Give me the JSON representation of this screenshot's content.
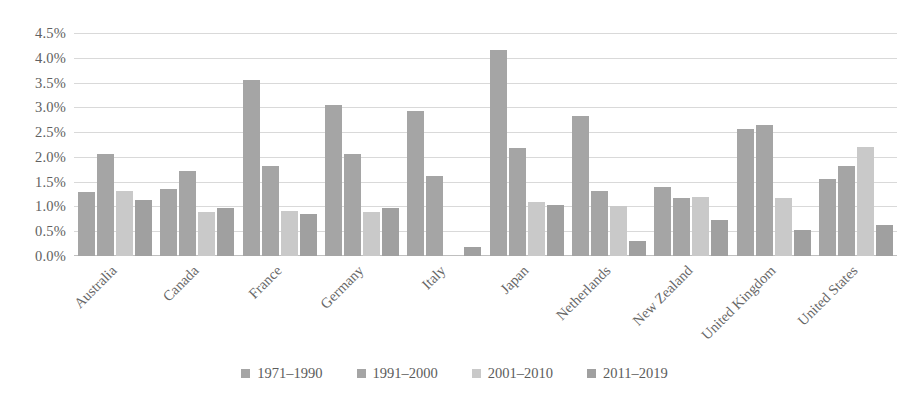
{
  "chart_data": {
    "type": "bar",
    "title": "",
    "xlabel": "",
    "ylabel": "",
    "ylim": [
      0,
      4.5
    ],
    "ytick_step": 0.5,
    "grid": true,
    "legend_position": "bottom",
    "value_unit": "percent",
    "categories": [
      "Australia",
      "Canada",
      "France",
      "Germany",
      "Italy",
      "Japan",
      "Netherlands",
      "New Zealand",
      "United Kingdom",
      "United States"
    ],
    "ytick_labels": [
      "4.5%",
      "4.0%",
      "3.5%",
      "3.0%",
      "2.5%",
      "2.0%",
      "1.5%",
      "1.0%",
      "0.5%",
      "0.0%"
    ],
    "ytick_values": [
      4.5,
      4.0,
      3.5,
      3.0,
      2.5,
      2.0,
      1.5,
      1.0,
      0.5,
      0.0
    ],
    "series": [
      {
        "name": "1971–1990",
        "color": "#a5a5a5",
        "values": [
          1.3,
          1.35,
          3.55,
          3.05,
          2.92,
          4.15,
          2.82,
          1.4,
          2.57,
          1.55
        ]
      },
      {
        "name": "1991–2000",
        "color": "#a5a5a5",
        "values": [
          2.05,
          1.72,
          1.82,
          2.05,
          1.62,
          2.18,
          1.32,
          1.18,
          2.65,
          1.82
        ]
      },
      {
        "name": "2001–2010",
        "color": "#c9c9c9",
        "values": [
          1.32,
          0.88,
          0.9,
          0.88,
          0.0,
          1.1,
          1.0,
          1.2,
          1.18,
          2.2
        ]
      },
      {
        "name": "2011–2019",
        "color": "#a0a0a0",
        "values": [
          1.13,
          0.97,
          0.85,
          0.97,
          0.18,
          1.03,
          0.3,
          0.73,
          0.52,
          0.63
        ]
      }
    ]
  },
  "style": {
    "gridline_color": "#d9d9d9",
    "axis_color": "#bfbfbf",
    "text_color": "#616161",
    "background": "#ffffff"
  }
}
